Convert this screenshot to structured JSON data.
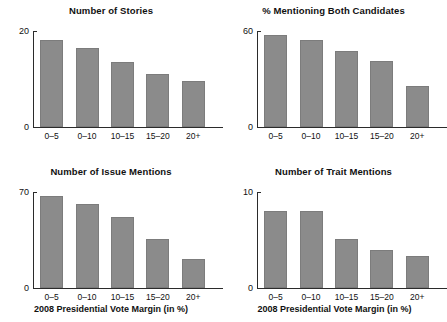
{
  "figure": {
    "shared_xlabel": "2008 Presidential Vote Margin (in %)",
    "categories": [
      "0–5",
      "0–10",
      "10–15",
      "15–20",
      "20+"
    ],
    "bar_color": "#8b8b8b",
    "axis_color": "#2b2b2b",
    "background": "#ffffff"
  },
  "chart_data": [
    {
      "type": "bar",
      "title": "Number of Stories",
      "xlabel": "",
      "ylabel": "",
      "categories": [
        "0–5",
        "0–10",
        "10–15",
        "15–20",
        "20+"
      ],
      "values": [
        18.1,
        16.4,
        13.6,
        11.0,
        9.5
      ],
      "ylim": [
        0,
        20
      ],
      "yticks": [
        0,
        20
      ],
      "ytick_labels": [
        "0",
        "20"
      ],
      "grid": false,
      "legend": "none"
    },
    {
      "type": "bar",
      "title": "% Mentioning Both Candidates",
      "xlabel": "",
      "ylabel": "",
      "categories": [
        "0–5",
        "0–10",
        "10–15",
        "15–20",
        "20+"
      ],
      "values": [
        57.5,
        54.5,
        47.5,
        41.5,
        25.5
      ],
      "ylim": [
        0,
        60
      ],
      "yticks": [
        0,
        60
      ],
      "ytick_labels": [
        "0",
        "60"
      ],
      "grid": false,
      "legend": "none"
    },
    {
      "type": "bar",
      "title": "Number of Issue Mentions",
      "xlabel": "2008 Presidential Vote Margin (in %)",
      "ylabel": "",
      "categories": [
        "0–5",
        "0–10",
        "10–15",
        "15–20",
        "20+"
      ],
      "values": [
        67.0,
        61.0,
        51.5,
        35.5,
        21.5
      ],
      "ylim": [
        0,
        70
      ],
      "yticks": [
        0,
        70
      ],
      "ytick_labels": [
        "0",
        "70"
      ],
      "grid": false,
      "legend": "none"
    },
    {
      "type": "bar",
      "title": "Number of Trait Mentions",
      "xlabel": "2008 Presidential Vote Margin (in %)",
      "ylabel": "",
      "categories": [
        "0–5",
        "0–10",
        "10–15",
        "15–20",
        "20+"
      ],
      "values": [
        8.0,
        8.05,
        5.1,
        4.0,
        3.3
      ],
      "ylim": [
        0,
        10
      ],
      "yticks": [
        0,
        10
      ],
      "ytick_labels": [
        "0",
        "10"
      ],
      "grid": false,
      "legend": "none"
    }
  ]
}
